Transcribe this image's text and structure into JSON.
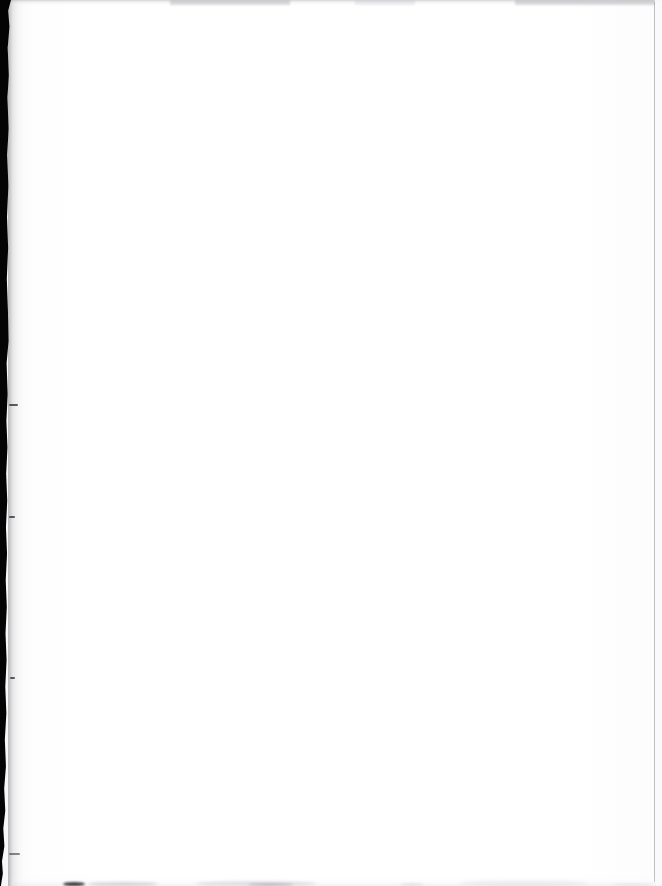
{
  "page": {
    "kind": "scanned-page",
    "width_px": 662,
    "height_px": 886,
    "orientation": "portrait",
    "background_color": "#ffffff",
    "ink_present": false,
    "visible_text": "",
    "blank_note": ""
  },
  "artifacts": {
    "gutter": {
      "name": "left binding gutter shadow",
      "side": "left",
      "color": "#040404",
      "approx_width_px": 11,
      "edge": "ragged",
      "spans_full_height": true
    },
    "top_shadow": {
      "name": "top edge shadow strip",
      "color": "#9a9aa2",
      "approx_height_px": 6,
      "opacity_description": "faint"
    },
    "right_rule": {
      "name": "right crop rule",
      "color": "#92929a",
      "approx_width_px": 1,
      "position_x_px": 654
    },
    "bottom_smudges": {
      "name": "bottom edge smudges",
      "color": "#b4b4be",
      "dark_mark_color": "#141418",
      "count": 7
    }
  }
}
